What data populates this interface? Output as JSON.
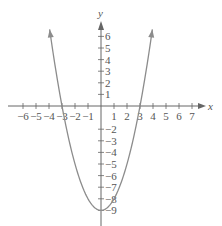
{
  "chart_data": {
    "type": "line",
    "title": "",
    "equation_form": "y = x^2 - 9",
    "xlabel": "x",
    "ylabel": "y",
    "xlim": [
      -7,
      7.5
    ],
    "ylim": [
      -9.5,
      7
    ],
    "x_ticks": [
      -6,
      -5,
      -4,
      -3,
      -2,
      -1,
      1,
      2,
      3,
      4,
      5,
      6,
      7
    ],
    "y_ticks": [
      -9,
      -8,
      -7,
      -6,
      -5,
      -4,
      -3,
      -2,
      1,
      2,
      3,
      4,
      5,
      6
    ],
    "grid": false,
    "legend": "none",
    "series": [
      {
        "name": "parabola",
        "color": "#8c8c8c",
        "vertex": [
          0,
          -9
        ],
        "x_intercepts": [
          -3,
          3
        ],
        "points": [
          [
            -3.95,
            6.6
          ],
          [
            -3,
            0
          ],
          [
            -2,
            -5
          ],
          [
            -1,
            -8
          ],
          [
            0,
            -9
          ],
          [
            1,
            -8
          ],
          [
            2,
            -5
          ],
          [
            3,
            0
          ],
          [
            3.95,
            6.6
          ]
        ],
        "arrows_both_ends": true
      }
    ]
  },
  "labels": {
    "x_axis": "x",
    "y_axis": "y"
  },
  "colors": {
    "axis": "#666666",
    "curve": "#8c8c8c",
    "text": "#555555"
  }
}
